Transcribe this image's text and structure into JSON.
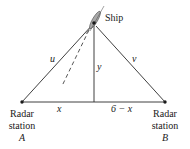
{
  "diagram": {
    "type": "triangle-geometry",
    "ship": {
      "label": "Ship",
      "icon": "ship-icon"
    },
    "sides": {
      "left_hypotenuse": "u",
      "right_hypotenuse": "v",
      "height": "y",
      "left_base": "x",
      "right_base": "6 − x"
    },
    "stations": [
      {
        "line1": "Radar",
        "line2": "station",
        "name": "A"
      },
      {
        "line1": "Radar",
        "line2": "station",
        "name": "B"
      }
    ],
    "colors": {
      "line": "#2a2a2a",
      "ship_fill": "#9a9a9a",
      "ship_dark": "#1a1a1a"
    }
  }
}
